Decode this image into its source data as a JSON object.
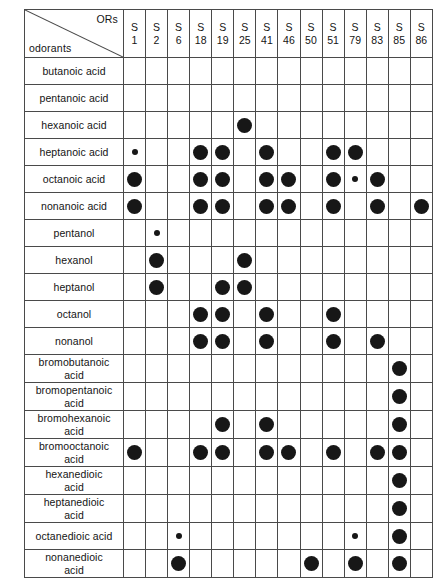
{
  "figure": {
    "corner": {
      "columns_label": "ORs",
      "rows_label": "odorants"
    },
    "dot_legend": {
      "strong": "large filled circle",
      "weak": "small filled circle",
      "none": "empty cell"
    }
  },
  "chart_data": {
    "type": "heatmap",
    "title": "",
    "xlabel": "ORs",
    "ylabel": "odorants",
    "grid": true,
    "legend_position": "none",
    "columns": [
      {
        "prefix": "S",
        "number": "1"
      },
      {
        "prefix": "S",
        "number": "2"
      },
      {
        "prefix": "S",
        "number": "6"
      },
      {
        "prefix": "S",
        "number": "18"
      },
      {
        "prefix": "S",
        "number": "19"
      },
      {
        "prefix": "S",
        "number": "25"
      },
      {
        "prefix": "S",
        "number": "41"
      },
      {
        "prefix": "S",
        "number": "46"
      },
      {
        "prefix": "S",
        "number": "50"
      },
      {
        "prefix": "S",
        "number": "51"
      },
      {
        "prefix": "S",
        "number": "79"
      },
      {
        "prefix": "S",
        "number": "83"
      },
      {
        "prefix": "S",
        "number": "85"
      },
      {
        "prefix": "S",
        "number": "86"
      }
    ],
    "rows": [
      {
        "label": "butanoic acid",
        "two_line": false,
        "values": [
          0,
          0,
          0,
          0,
          0,
          0,
          0,
          0,
          0,
          0,
          0,
          0,
          0,
          0
        ]
      },
      {
        "label": "pentanoic acid",
        "two_line": false,
        "values": [
          0,
          0,
          0,
          0,
          0,
          0,
          0,
          0,
          0,
          0,
          0,
          0,
          0,
          0
        ]
      },
      {
        "label": "hexanoic acid",
        "two_line": false,
        "values": [
          0,
          0,
          0,
          0,
          0,
          2,
          0,
          0,
          0,
          0,
          0,
          0,
          0,
          0
        ]
      },
      {
        "label": "heptanoic acid",
        "two_line": false,
        "values": [
          1,
          0,
          0,
          2,
          2,
          0,
          2,
          0,
          0,
          2,
          2,
          0,
          0,
          0
        ]
      },
      {
        "label": "octanoic acid",
        "two_line": false,
        "values": [
          2,
          0,
          0,
          2,
          2,
          0,
          2,
          2,
          0,
          2,
          1,
          2,
          0,
          0
        ]
      },
      {
        "label": "nonanoic acid",
        "two_line": false,
        "values": [
          2,
          0,
          0,
          2,
          2,
          0,
          2,
          2,
          0,
          2,
          0,
          2,
          0,
          2
        ]
      },
      {
        "label": "pentanol",
        "two_line": false,
        "values": [
          0,
          1,
          0,
          0,
          0,
          0,
          0,
          0,
          0,
          0,
          0,
          0,
          0,
          0
        ]
      },
      {
        "label": "hexanol",
        "two_line": false,
        "values": [
          0,
          2,
          0,
          0,
          0,
          2,
          0,
          0,
          0,
          0,
          0,
          0,
          0,
          0
        ]
      },
      {
        "label": "heptanol",
        "two_line": false,
        "values": [
          0,
          2,
          0,
          0,
          2,
          2,
          0,
          0,
          0,
          0,
          0,
          0,
          0,
          0
        ]
      },
      {
        "label": "octanol",
        "two_line": false,
        "values": [
          0,
          0,
          0,
          2,
          2,
          0,
          2,
          0,
          0,
          2,
          0,
          0,
          0,
          0
        ]
      },
      {
        "label": "nonanol",
        "two_line": false,
        "values": [
          0,
          0,
          0,
          2,
          2,
          0,
          2,
          0,
          0,
          2,
          0,
          2,
          0,
          0
        ]
      },
      {
        "label": "bromobutanoic\nacid",
        "two_line": true,
        "values": [
          0,
          0,
          0,
          0,
          0,
          0,
          0,
          0,
          0,
          0,
          0,
          0,
          2,
          0
        ]
      },
      {
        "label": "bromopentanoic\nacid",
        "two_line": true,
        "values": [
          0,
          0,
          0,
          0,
          0,
          0,
          0,
          0,
          0,
          0,
          0,
          0,
          2,
          0
        ]
      },
      {
        "label": "bromohexanoic\nacid",
        "two_line": true,
        "values": [
          0,
          0,
          0,
          0,
          2,
          0,
          2,
          0,
          0,
          0,
          0,
          0,
          2,
          0
        ]
      },
      {
        "label": "bromooctanoic\nacid",
        "two_line": true,
        "values": [
          2,
          0,
          0,
          2,
          2,
          0,
          2,
          2,
          0,
          2,
          0,
          2,
          2,
          0
        ]
      },
      {
        "label": "hexanedioic\nacid",
        "two_line": true,
        "values": [
          0,
          0,
          0,
          0,
          0,
          0,
          0,
          0,
          0,
          0,
          0,
          0,
          2,
          0
        ]
      },
      {
        "label": "heptanedioic\nacid",
        "two_line": true,
        "values": [
          0,
          0,
          0,
          0,
          0,
          0,
          0,
          0,
          0,
          0,
          0,
          0,
          2,
          0
        ]
      },
      {
        "label": "octanedioic acid",
        "two_line": false,
        "values": [
          0,
          0,
          1,
          0,
          0,
          0,
          0,
          0,
          0,
          0,
          1,
          0,
          2,
          0
        ]
      },
      {
        "label": "nonanedioic\nacid",
        "two_line": true,
        "values": [
          0,
          0,
          2,
          0,
          0,
          0,
          0,
          0,
          2,
          0,
          2,
          0,
          2,
          0
        ]
      }
    ]
  }
}
